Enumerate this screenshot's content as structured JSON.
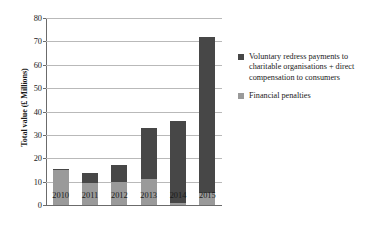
{
  "chart_data": {
    "type": "bar",
    "stacked": true,
    "title": "",
    "xlabel": "",
    "ylabel": "Total value (£ Millions)",
    "categories": [
      "2010",
      "2011",
      "2012",
      "2013",
      "2014",
      "2015"
    ],
    "ylim": [
      0,
      80
    ],
    "yticks": [
      0,
      10,
      20,
      30,
      40,
      50,
      60,
      70,
      80
    ],
    "ytick_labels": [
      "0",
      "10",
      "20",
      "30",
      "40",
      "50",
      "60",
      "70",
      "80"
    ],
    "grid": true,
    "legend_position": "right",
    "series": [
      {
        "name": "Financial penalties",
        "color": "#9a9a9a",
        "values": [
          15.0,
          9.5,
          10.0,
          11.0,
          1.0,
          5.0
        ]
      },
      {
        "name": "Voluntary redress payments to charitable organisations + direct compensation to consumers",
        "color": "#474747",
        "values": [
          0.3,
          4.3,
          7.0,
          22.0,
          34.8,
          66.8
        ]
      }
    ],
    "totals": [
      15.3,
      13.8,
      17.0,
      33.0,
      35.8,
      71.8
    ]
  },
  "legend": {
    "items": [
      {
        "label": "Voluntary redress payments to charitable organisations + direct compensation to consumers",
        "color": "#474747"
      },
      {
        "label": "Financial penalties",
        "color": "#9a9a9a"
      }
    ]
  },
  "colors": {
    "dark_series": "#474747",
    "light_series": "#9a9a9a",
    "gridline": "#b9b9b9",
    "axis": "#6b6b6b",
    "background": "#ffffff",
    "text": "#1a1a1a"
  }
}
